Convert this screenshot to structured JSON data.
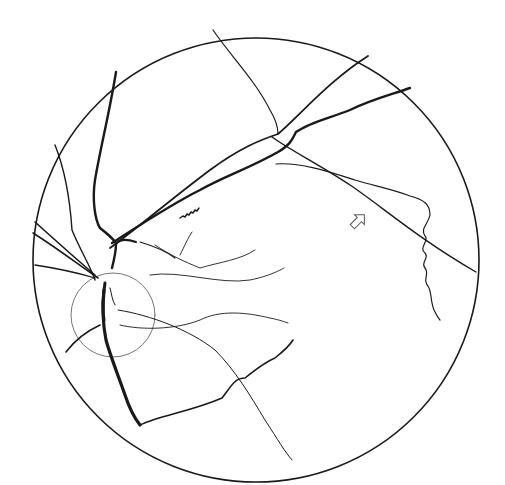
{
  "diagram": {
    "title": "",
    "width": 505,
    "height": 485,
    "background": "#ffffff",
    "ink": "#1a1a1a",
    "fundus_border": {
      "cx": 256,
      "cy": 260,
      "rx": 223,
      "ry": 222,
      "stroke": "#1a1a1a",
      "width": 1.6
    },
    "optic_disc": {
      "cx": 113,
      "cy": 315,
      "r": 42,
      "stroke": "#666666",
      "width": 0.9
    },
    "arrow": {
      "x": 358,
      "y": 221,
      "angle": -45,
      "stroke": "#555555"
    },
    "vessels": [
      {
        "name": "superior-artery-main",
        "w": 1.8,
        "d": "M110 248 C 135 230 170 200 210 170 C 240 148 260 140 278 134 C 300 115 330 80 368 56"
      },
      {
        "name": "superior-vein-main",
        "w": 2.4,
        "d": "M112 243 C 140 225 170 205 200 190 C 225 176 250 168 278 152 C 290 145 292 140 296 132 C 310 122 330 118 350 110 C 370 100 390 95 410 88"
      },
      {
        "name": "superior-tortuous-segment",
        "w": 1.4,
        "d": "M180 218 l3 -2 l2 1 l2 -3 l2 1 l2 -3 l2 1 l2 -3 l2 1 l2 -3"
      },
      {
        "name": "upper-left-vein",
        "w": 2.4,
        "d": "M116 72 C 110 110 100 150 95 180 C 92 200 95 220 100 228 C 110 236 115 240 116 244 C 116 252 114 260 112 268"
      },
      {
        "name": "upper-left-branch-ring",
        "w": 2.2,
        "d": "M116 244 C 120 238 130 240 136 242"
      },
      {
        "name": "oblique-crossing-vessel",
        "w": 1.4,
        "d": "M272 137 C 290 150 320 165 350 185 C 380 205 420 240 476 272"
      },
      {
        "name": "top-vertical-vessel",
        "w": 1.2,
        "d": "M213 30 C 230 55 255 80 270 110 C 276 120 278 128 278 134"
      },
      {
        "name": "tortuous-temporal-vein",
        "w": 1.2,
        "d": "M276 164 C 300 162 330 172 355 180 C 375 186 395 190 410 196 C 425 200 430 205 430 215 C 428 225 420 228 425 236 C 430 240 418 248 425 253 C 430 258 420 262 425 268 C 430 274 422 280 428 286 C 432 292 430 300 434 310 C 436 314 438 318 440 320"
      },
      {
        "name": "left-nasal-upper",
        "w": 1.4,
        "d": "M55 145 C 65 170 70 200 72 230 C 80 250 90 265 95 280"
      },
      {
        "name": "left-nasal-mid-1",
        "w": 1.6,
        "d": "M35 222 C 55 240 75 258 95 275"
      },
      {
        "name": "left-nasal-mid-2",
        "w": 1.6,
        "d": "M33 233 C 60 250 80 266 98 278"
      },
      {
        "name": "left-nasal-low",
        "w": 1.3,
        "d": "M35 265 C 55 268 75 272 95 278"
      },
      {
        "name": "inferior-vein-main",
        "w": 3.2,
        "d": "M104 290 C 102 310 103 325 106 340 C 110 355 118 375 125 395 C 130 410 136 420 140 425"
      },
      {
        "name": "inferior-vein-start",
        "w": 3.0,
        "d": "M105 283 C 103 295 102 308 104 320"
      },
      {
        "name": "inferior-nasal-artery",
        "w": 1.6,
        "d": "M66 352 C 75 340 85 332 100 325"
      },
      {
        "name": "inferior-temporal-artery",
        "w": 1.6,
        "d": "M140 425 C 160 415 190 412 222 398 C 232 385 235 378 245 378 C 255 370 265 362 275 358 C 285 350 290 345 293 340"
      },
      {
        "name": "inferior-temporal-thin",
        "w": 1.0,
        "d": "M118 310 C 150 315 190 330 215 350 C 235 370 250 395 265 420 C 278 440 285 452 292 460"
      },
      {
        "name": "macular-branch-1",
        "w": 0.9,
        "d": "M120 325 C 140 330 175 330 200 320 C 220 310 245 312 270 318 C 280 320 285 322 288 323"
      },
      {
        "name": "macular-branch-2",
        "w": 0.9,
        "d": "M150 275 C 180 270 220 285 250 280 C 270 276 280 270 284 268"
      },
      {
        "name": "macular-branch-3",
        "w": 0.9,
        "d": "M155 245 C 170 255 185 262 200 268 C 220 262 240 260 255 250"
      },
      {
        "name": "macular-branch-4",
        "w": 0.9,
        "d": "M180 255 C 185 245 188 238 192 232"
      },
      {
        "name": "superior-small-branch",
        "w": 1.2,
        "d": "M140 242 C 150 245 165 250 175 258"
      },
      {
        "name": "disc-inner-vessel",
        "w": 1.0,
        "d": "M110 288 C 112 295 112 300 115 305"
      }
    ]
  }
}
